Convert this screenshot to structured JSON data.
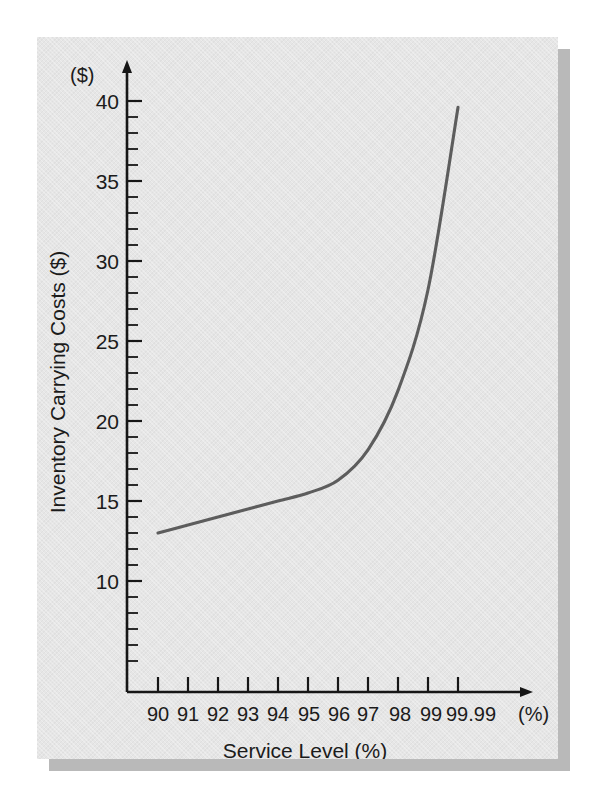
{
  "figure": {
    "panel_background": "#e6e6e6",
    "page_background": "#ffffff",
    "shadow_color": "#b9b9b9"
  },
  "axes": {
    "y_unit_label": "($)",
    "x_unit_label": "(%)",
    "y_axis_title": "Inventory Carrying Costs ($)",
    "x_axis_title": "Service Level (%)",
    "y_tick_labels": [
      "40",
      "35",
      "30",
      "25",
      "20",
      "15",
      "10"
    ],
    "x_tick_labels": [
      "90",
      "91",
      "92",
      "93",
      "94",
      "95",
      "96",
      "97",
      "98",
      "99",
      "99.99"
    ]
  },
  "chart_data": {
    "type": "line",
    "title": "",
    "subtitle": "",
    "xlabel": "Service Level (%)",
    "ylabel": "Inventory Carrying Costs ($)",
    "x_unit": "(%)",
    "y_unit": "($)",
    "grid": false,
    "legend": null,
    "legend_position": "none",
    "curve_color": "#5d5d5d",
    "axis_color": "#161616",
    "x_tick_labels": [
      "90",
      "91",
      "92",
      "93",
      "94",
      "95",
      "96",
      "97",
      "98",
      "99",
      "99.99"
    ],
    "x_tick_values": [
      90,
      91,
      92,
      93,
      94,
      95,
      96,
      97,
      98,
      99,
      99.99
    ],
    "x_axis_spacing": "ordinal-equal",
    "y_ticks_major": [
      10,
      15,
      20,
      25,
      30,
      35,
      40
    ],
    "y_minor_tick_step": 1,
    "ylim": [
      8,
      42
    ],
    "ylabel_unit": "$",
    "series": [
      {
        "name": "Inventory Carrying Costs",
        "x": [
          "90",
          "91",
          "92",
          "93",
          "94",
          "95",
          "96",
          "97",
          "98",
          "99",
          "99.99"
        ],
        "values": [
          13.0,
          13.5,
          14.0,
          14.5,
          15.0,
          15.5,
          16.3,
          18.2,
          21.9,
          28.2,
          39.6
        ]
      }
    ],
    "annotations": []
  }
}
